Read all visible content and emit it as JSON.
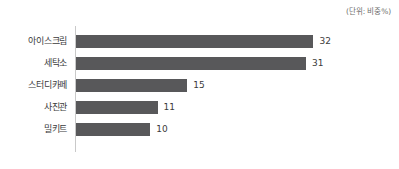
{
  "unit_note": "(단위: 비중%)",
  "colors": {
    "bar": "#58585a",
    "axis": "#c9c9c9",
    "text": "#3b3b3b",
    "note": "#6e6e6e",
    "background": "#ffffff"
  },
  "chart_data": {
    "type": "bar",
    "orientation": "horizontal",
    "title": "",
    "subtitle": "",
    "xlabel": "",
    "ylabel": "",
    "unit_note": "(단위: 비중%)",
    "grid": false,
    "legend": false,
    "xlim": [
      0,
      32
    ],
    "categories": [
      "아이스크림",
      "세탁소",
      "스터디카페",
      "사진관",
      "밀키트"
    ],
    "values": [
      32,
      31,
      15,
      11,
      10
    ],
    "value_labels": [
      "32",
      "31",
      "15",
      "11",
      "10"
    ],
    "series": [
      {
        "name": "비중",
        "values": [
          32,
          31,
          15,
          11,
          10
        ]
      }
    ],
    "points": [
      {
        "category": "아이스크림",
        "value": 32,
        "label": "32"
      },
      {
        "category": "세탁소",
        "value": 31,
        "label": "31"
      },
      {
        "category": "스터디카페",
        "value": 15,
        "label": "15"
      },
      {
        "category": "사진관",
        "value": 11,
        "label": "11"
      },
      {
        "category": "밀키트",
        "value": 10,
        "label": "10"
      }
    ]
  }
}
